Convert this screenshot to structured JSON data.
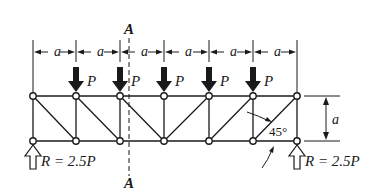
{
  "diagram": {
    "type": "truss",
    "section_label_top": "A",
    "section_label_bottom": "A",
    "panel_label": "a",
    "height_label": "a",
    "load_label": "P",
    "angle_label": "45°",
    "reaction_left": "R = 2.5P",
    "reaction_right": "R = 2.5P",
    "panels": 6,
    "loads_count": 5,
    "colors": {
      "ink": "#1a1a1a",
      "background": "#ffffff"
    }
  }
}
